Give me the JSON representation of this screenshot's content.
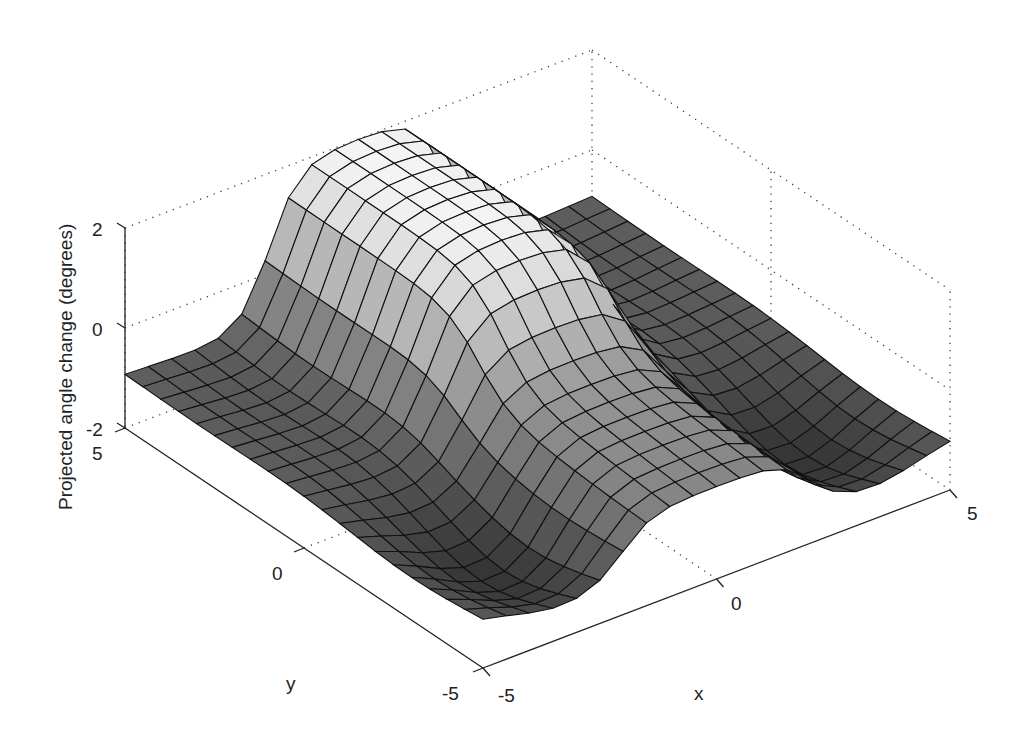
{
  "chart_data": {
    "type": "surface3d",
    "title": "",
    "xlabel": "x",
    "ylabel": "y",
    "zlabel": "Projected angle change (degrees)",
    "xlim": [
      -5,
      5
    ],
    "ylim": [
      -5,
      5
    ],
    "zlim": [
      -2,
      2
    ],
    "x_ticks": [
      "-5",
      "0",
      "5"
    ],
    "y_ticks": [
      "-5",
      "0",
      "5"
    ],
    "z_ticks": [
      "-2",
      "0",
      "2"
    ],
    "grid": "dotted box edges",
    "colormap": "gray",
    "grid_resolution": 21,
    "sample_points": [
      {
        "x": 0,
        "y": 5,
        "z": 2.0
      },
      {
        "x": 0,
        "y": 2.5,
        "z": 1.9
      },
      {
        "x": 0,
        "y": 0,
        "z": 0.6
      },
      {
        "x": 0,
        "y": -2.5,
        "z": 0.2
      },
      {
        "x": 0,
        "y": -5,
        "z": -0.4
      },
      {
        "x": -5,
        "y": 5,
        "z": -0.9
      },
      {
        "x": 5,
        "y": 5,
        "z": -0.9
      },
      {
        "x": -5,
        "y": -5,
        "z": -1.0
      },
      {
        "x": 5,
        "y": -5,
        "z": -1.0
      },
      {
        "x": -3,
        "y": -3,
        "z": -1.8
      },
      {
        "x": 3,
        "y": -3,
        "z": -1.8
      }
    ]
  },
  "axes": {
    "z_tick_labels": [
      "2",
      "0",
      "-2"
    ],
    "y_tick_labels": [
      "5",
      "0",
      "-5"
    ],
    "x_tick_labels": [
      "-5",
      "0",
      "5"
    ],
    "x_label": "x",
    "y_label": "y",
    "z_label": "Projected angle change (degrees)"
  }
}
